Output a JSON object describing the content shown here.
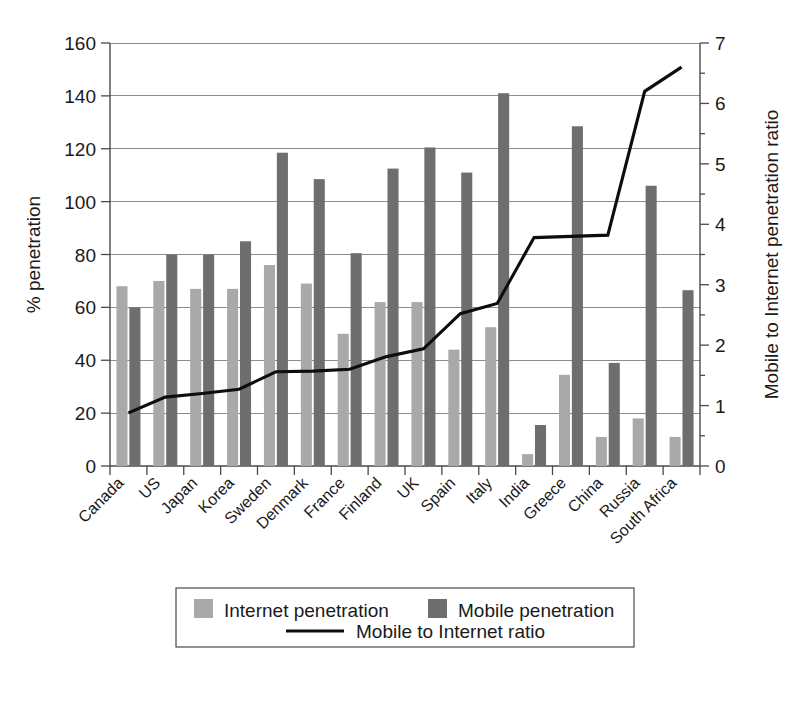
{
  "chart_data": {
    "type": "bar",
    "title": "",
    "subtitle": "",
    "xlabel": "",
    "ylabel": "% penetration",
    "y2label": "Mobile to Internet penetration ratio",
    "ylim": [
      0,
      160
    ],
    "y2lim": [
      0,
      7
    ],
    "yticks": [
      "0",
      "20",
      "40",
      "60",
      "80",
      "100",
      "120",
      "140",
      "160"
    ],
    "y2ticks": [
      "0",
      "1",
      "2",
      "3",
      "4",
      "5",
      "6",
      "7"
    ],
    "grid": true,
    "legend_position": "bottom",
    "categories": [
      "Canada",
      "US",
      "Japan",
      "Korea",
      "Sweden",
      "Denmark",
      "France",
      "Finland",
      "UK",
      "Spain",
      "Italy",
      "India",
      "Greece",
      "China",
      "Russia",
      "South Africa"
    ],
    "series": [
      {
        "name": "Internet penetration",
        "type": "bar",
        "axis": "left",
        "color": "#a9a9a9",
        "values": [
          68,
          70,
          67,
          67,
          76,
          69,
          50,
          62,
          62,
          44,
          52.5,
          4.5,
          34.5,
          11,
          18,
          11
        ]
      },
      {
        "name": "Mobile penetration",
        "type": "bar",
        "axis": "left",
        "color": "#6e6e6e",
        "values": [
          60,
          80,
          80,
          85,
          118.5,
          108.5,
          80.5,
          112.5,
          120.5,
          111,
          141,
          15.5,
          128.5,
          39,
          106,
          66.5
        ]
      },
      {
        "name": "Mobile to Internet ratio",
        "type": "line",
        "axis": "right",
        "color": "#0d0d0d",
        "values": [
          0.88,
          1.14,
          1.2,
          1.27,
          1.56,
          1.57,
          1.6,
          1.81,
          1.94,
          2.52,
          2.69,
          3.78,
          3.8,
          3.82,
          6.2,
          6.6
        ]
      }
    ],
    "legend": [
      {
        "label": "Internet penetration",
        "marker": "swatch",
        "color": "#a9a9a9"
      },
      {
        "label": "Mobile penetration",
        "marker": "swatch",
        "color": "#6e6e6e"
      },
      {
        "label": "Mobile to Internet ratio",
        "marker": "line",
        "color": "#0d0d0d"
      }
    ]
  }
}
